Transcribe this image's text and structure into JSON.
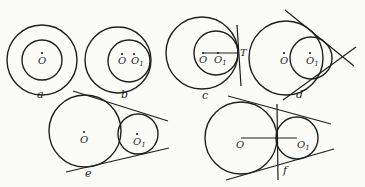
{
  "figures": {
    "a": {
      "caption": "a",
      "center_label": "O"
    },
    "b": {
      "caption": "b",
      "center_label": "O",
      "center2_label": "O",
      "center2_sub": "1"
    },
    "c": {
      "caption": "c",
      "center_label": "O",
      "center2_label": "O",
      "center2_sub": "1",
      "tangent_label": "T"
    },
    "d": {
      "caption": "d",
      "center_label": "O",
      "center2_label": "O",
      "center2_sub": "1"
    },
    "e": {
      "caption": "e",
      "center_label": "O",
      "center2_label": "O",
      "center2_sub": "1"
    },
    "f": {
      "caption": "f",
      "center_label": "O",
      "center2_label": "O",
      "center2_sub": "1"
    }
  }
}
